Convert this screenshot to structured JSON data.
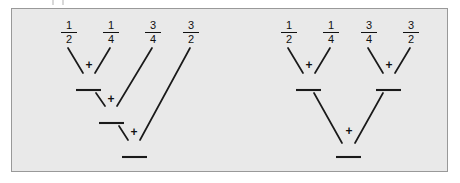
{
  "figure": {
    "panel_background": "#e9e9e9",
    "panel_border_color": "#999999",
    "stroke_color": "#1a1a1a",
    "page_background": "#ffffff"
  },
  "operator": {
    "symbol": "+",
    "name": "plus-sign"
  },
  "trees": [
    {
      "id": "left-tree",
      "name": "sequential-reduction-tree",
      "shape": "left-leaning-cascade",
      "leaves": [
        {
          "label": "1/2",
          "numerator": "1",
          "denominator": "2"
        },
        {
          "label": "1/4",
          "numerator": "1",
          "denominator": "4"
        },
        {
          "label": "3/4",
          "numerator": "3",
          "denominator": "4"
        },
        {
          "label": "3/2",
          "numerator": "3",
          "denominator": "2"
        }
      ],
      "operator_count": 3,
      "depth": 3,
      "result_bars": 3
    },
    {
      "id": "right-tree",
      "name": "balanced-reduction-tree",
      "shape": "balanced-pairwise",
      "leaves": [
        {
          "label": "1/2",
          "numerator": "1",
          "denominator": "2"
        },
        {
          "label": "1/4",
          "numerator": "1",
          "denominator": "4"
        },
        {
          "label": "3/4",
          "numerator": "3",
          "denominator": "4"
        },
        {
          "label": "3/2",
          "numerator": "3",
          "denominator": "2"
        }
      ],
      "operator_count": 3,
      "depth": 2,
      "result_bars": 3
    }
  ],
  "left_tree_leaf_labels": {
    "l0_num": "1",
    "l0_den": "2",
    "l1_num": "1",
    "l1_den": "4",
    "l2_num": "3",
    "l2_den": "4",
    "l3_num": "3",
    "l3_den": "2"
  },
  "right_tree_leaf_labels": {
    "r0_num": "1",
    "r0_den": "2",
    "r1_num": "1",
    "r1_den": "4",
    "r2_num": "3",
    "r2_den": "4",
    "r3_num": "3",
    "r3_den": "2"
  },
  "operators": {
    "left_op1": "+",
    "left_op2": "+",
    "left_op3": "+",
    "right_op1": "+",
    "right_op2": "+",
    "right_op3": "+"
  }
}
